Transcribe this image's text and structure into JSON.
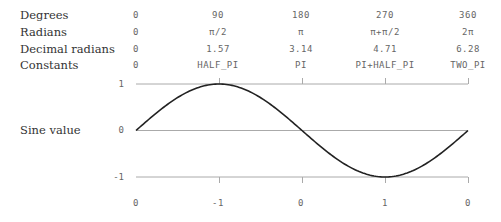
{
  "table": {
    "rows": [
      {
        "label": "Degrees",
        "values": [
          "0",
          "90",
          "180",
          "270",
          "360"
        ]
      },
      {
        "label": "Radians",
        "values": [
          "0",
          "π/2",
          "π",
          "π+π/2",
          "2π"
        ]
      },
      {
        "label": "Decimal radians",
        "values": [
          "0",
          "1.57",
          "3.14",
          "4.71",
          "6.28"
        ]
      },
      {
        "label": "Constants",
        "values": [
          "0",
          "HALF_PI",
          "PI",
          "PI+HALF_PI",
          "TWO_PI"
        ]
      }
    ]
  },
  "chart_data": {
    "type": "line",
    "title": "",
    "ylabel": "Sine value",
    "xlabel": "",
    "x_degrees": [
      0,
      90,
      180,
      270,
      360
    ],
    "xlim": [
      0,
      360
    ],
    "ylim": [
      -1,
      1
    ],
    "y_ticks": [
      "1",
      "0",
      "-1"
    ],
    "bottom_labels": [
      "0",
      "-1",
      "0",
      "1",
      "0"
    ],
    "series": [
      {
        "name": "sin",
        "function": "sin(x)",
        "x": [
          0,
          90,
          180,
          270,
          360
        ],
        "values": [
          0,
          1,
          0,
          -1,
          0
        ]
      }
    ],
    "gridlines": [
      1,
      0,
      -1
    ],
    "colors": {
      "curve": "#222222",
      "grid": "#aaaaaa",
      "text": "#666666"
    }
  }
}
